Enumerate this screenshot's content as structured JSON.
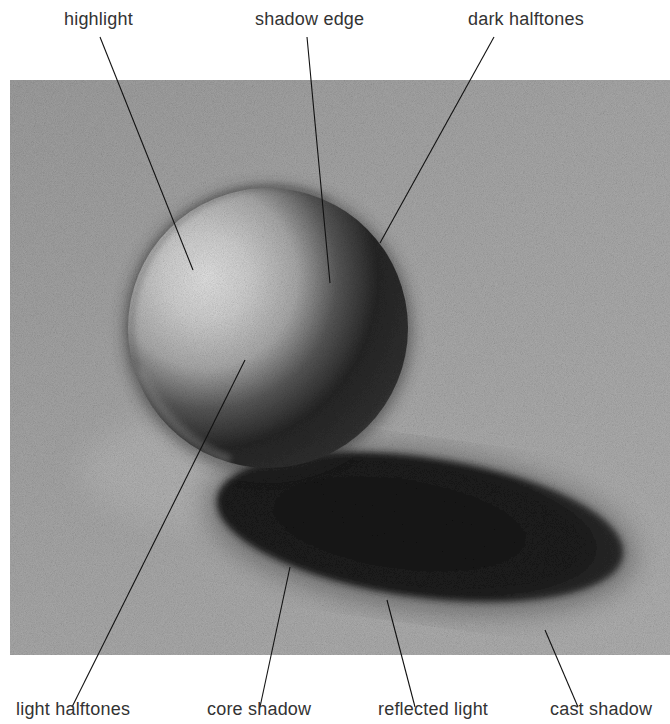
{
  "diagram": {
    "colors": {
      "background": "#ffffff",
      "paper": "#a6a6a6",
      "label_text": "#333333",
      "leader_line": "#111111"
    },
    "labels_top": [
      {
        "id": "highlight",
        "text": "highlight"
      },
      {
        "id": "shadow-edge",
        "text": "shadow edge"
      },
      {
        "id": "dark-halftones",
        "text": "dark halftones"
      }
    ],
    "labels_bottom": [
      {
        "id": "light-halftones",
        "text": "light halftones"
      },
      {
        "id": "core-shadow",
        "text": "core shadow"
      },
      {
        "id": "reflected-light",
        "text": "reflected light"
      },
      {
        "id": "cast-shadow",
        "text": "cast shadow"
      }
    ]
  }
}
